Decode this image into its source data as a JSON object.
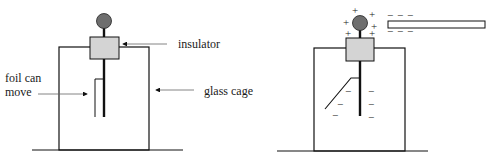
{
  "diagram": {
    "type": "electroscope comparison",
    "left": {
      "state": "uncharged",
      "labels": {
        "insulator": "insulator",
        "foil_line1": "foil can",
        "foil_line2": "move",
        "glass_cage": "glass cage"
      }
    },
    "right": {
      "state": "charged by induction",
      "sphere_charges": [
        "+",
        "+",
        "+",
        "+",
        "+",
        "+"
      ],
      "rod_charges_top": [
        "−",
        "−",
        "−"
      ],
      "rod_charges_bottom": [
        "−",
        "−",
        "−"
      ],
      "foil_charges": [
        "−",
        "−",
        "−"
      ],
      "rod_stem_charges": [
        "−",
        "−",
        "−"
      ]
    },
    "colors": {
      "sphere": "#6e6e6e",
      "insulator": "#d4d4d4",
      "line": "#111111"
    }
  }
}
